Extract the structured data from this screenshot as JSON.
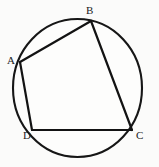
{
  "figure": {
    "kind": "geometry-diagram",
    "background_color": "#fbfbfa",
    "stroke_color": "#131313",
    "label_color": "#1a1a1a",
    "canvas": {
      "width": 159,
      "height": 167
    },
    "circle": {
      "name": "circumscribed-circle",
      "center_x": 77.5,
      "center_y": 88,
      "radius_x": 64.5,
      "radius_y": 69,
      "fill": "#fdfdfc",
      "stroke_width": 2.1
    },
    "vertices": [
      {
        "id": "A",
        "label": "A",
        "x": 20,
        "y": 62,
        "label_x": 7,
        "label_y": 55
      },
      {
        "id": "B",
        "label": "B",
        "x": 91,
        "y": 21,
        "label_x": 86,
        "label_y": 5
      },
      {
        "id": "C",
        "label": "C",
        "x": 132,
        "y": 130,
        "label_x": 136,
        "label_y": 130
      },
      {
        "id": "D",
        "label": "D",
        "x": 32,
        "y": 130,
        "label_x": 23,
        "label_y": 130
      }
    ],
    "edges": [
      {
        "id": "AB",
        "name": "segment-ab",
        "from": "A",
        "to": "B",
        "x1": 20,
        "y1": 62,
        "x2": 91,
        "y2": 21
      },
      {
        "id": "BC",
        "name": "segment-bc",
        "from": "B",
        "to": "C",
        "x1": 91,
        "y1": 21,
        "x2": 132,
        "y2": 130
      },
      {
        "id": "CD",
        "name": "segment-cd",
        "from": "C",
        "to": "D",
        "x1": 132,
        "y1": 130,
        "x2": 32,
        "y2": 130
      },
      {
        "id": "DA",
        "name": "segment-da",
        "from": "D",
        "to": "A",
        "x1": 32,
        "y1": 130,
        "x2": 20,
        "y2": 62
      }
    ]
  }
}
